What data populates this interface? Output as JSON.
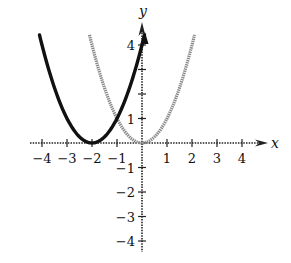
{
  "chart_data": {
    "type": "line",
    "title": "",
    "xlabel": "x",
    "ylabel": "y",
    "xlim": [
      -4,
      4
    ],
    "ylim": [
      -4,
      4
    ],
    "grid": false,
    "legend": null,
    "x_ticks": [
      -4,
      -3,
      -2,
      -1,
      1,
      2,
      3,
      4
    ],
    "x_tick_labels": [
      "−4",
      "−3",
      "−2",
      "−1",
      "1",
      "2",
      "3",
      "4"
    ],
    "y_ticks": [
      4,
      1,
      -1,
      -2,
      -3,
      -4
    ],
    "y_tick_labels": [
      "4",
      "1",
      "−1",
      "−2",
      "−3",
      "−4"
    ],
    "y_minor_ticks": [
      3,
      2
    ],
    "series": [
      {
        "name": "y = (x + 2)^2",
        "style": "solid thick black",
        "color": "#111111",
        "x": [
          -4.1,
          -4,
          -3.5,
          -3,
          -2.5,
          -2,
          -1.5,
          -1,
          -0.5,
          0,
          0.1
        ],
        "y": [
          4.41,
          4,
          2.25,
          1,
          0.25,
          0,
          0.25,
          1,
          2.25,
          4,
          4.41
        ]
      },
      {
        "name": "y = x^2",
        "style": "dotted gray",
        "color": "#8a8a8a",
        "x": [
          -2.1,
          -2,
          -1.5,
          -1,
          -0.5,
          0,
          0.5,
          1,
          1.5,
          2,
          2.1
        ],
        "y": [
          4.41,
          4,
          2.25,
          1,
          0.25,
          0,
          0.25,
          1,
          2.25,
          4,
          4.41
        ]
      }
    ]
  }
}
